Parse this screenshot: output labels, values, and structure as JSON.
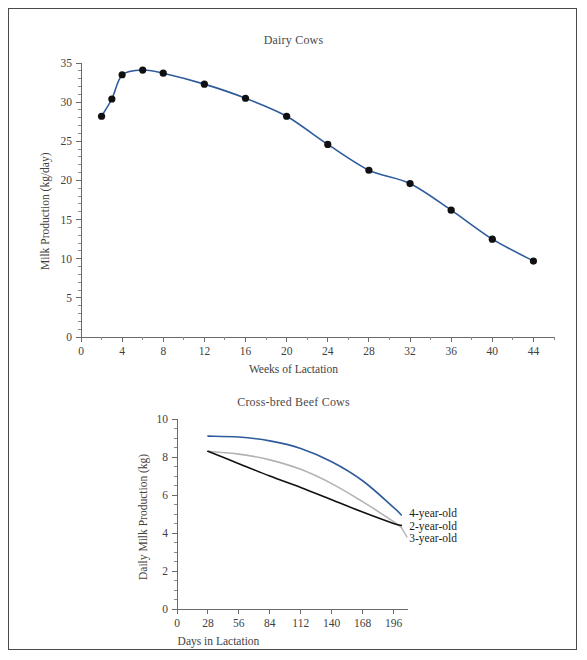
{
  "figure": {
    "border_color": "#4a4a4a",
    "background": "#ffffff"
  },
  "chart_data": [
    {
      "id": "dairy-cows",
      "type": "line",
      "title": "Dairy Cows",
      "xlabel": "Weeks of Lactation",
      "ylabel": "Milk Production (kg/day)",
      "xlim": [
        0,
        46
      ],
      "ylim": [
        0,
        35
      ],
      "xticks": [
        0,
        4,
        8,
        12,
        16,
        20,
        24,
        28,
        32,
        36,
        40,
        44
      ],
      "xtick_labels": [
        "0",
        "4",
        "8",
        "12",
        "16",
        "20",
        "24",
        "28",
        "32",
        "36",
        "40",
        "44"
      ],
      "yticks": [
        0,
        5,
        10,
        15,
        20,
        25,
        30,
        35
      ],
      "ytick_labels": [
        "0",
        "5",
        "10",
        "15",
        "20",
        "25",
        "30",
        "35"
      ],
      "y_minor_step": 1,
      "grid": false,
      "legend": "none",
      "line_color": "#2f5b9c",
      "marker_color": "#101010",
      "marker_shape": "circle",
      "x": [
        2,
        3,
        4,
        6,
        8,
        12,
        16,
        20,
        24,
        28,
        32,
        36,
        40,
        44
      ],
      "values": [
        28.2,
        30.4,
        33.5,
        34.1,
        33.7,
        32.3,
        30.5,
        28.2,
        24.6,
        21.3,
        19.6,
        16.2,
        12.5,
        9.7
      ]
    },
    {
      "id": "cross-bred-beef-cows",
      "type": "line",
      "title": "Cross-bred Beef Cows",
      "xlabel": "Days in Lactation",
      "ylabel": "Daily Milk Production (kg)",
      "xlim": [
        0,
        210
      ],
      "ylim": [
        0,
        10
      ],
      "xticks": [
        0,
        28,
        56,
        84,
        112,
        140,
        168,
        196
      ],
      "xtick_labels": [
        "0",
        "28",
        "56",
        "84",
        "112",
        "140",
        "168",
        "196"
      ],
      "yticks": [
        0,
        2,
        4,
        6,
        8,
        10
      ],
      "ytick_labels": [
        "0",
        "2",
        "4",
        "6",
        "8",
        "10"
      ],
      "y_minor_step": 0.5,
      "grid": false,
      "legend": "inline-right",
      "x": [
        28,
        56,
        84,
        112,
        140,
        168,
        196,
        203
      ],
      "series": [
        {
          "name": "4-year-old",
          "color": "#2f5b9c",
          "label_color": "#1d1d1d",
          "values": [
            9.1,
            9.05,
            8.85,
            8.45,
            7.75,
            6.75,
            5.35,
            4.95
          ]
        },
        {
          "name": "3-year-old",
          "color": "#b3b3b3",
          "label_color": "#1d1d1d",
          "values": [
            8.3,
            8.15,
            7.85,
            7.35,
            6.6,
            5.65,
            4.6,
            4.3
          ]
        },
        {
          "name": "2-year-old",
          "color": "#101010",
          "label_color": "#1d1d1d",
          "values": [
            8.3,
            7.65,
            7.0,
            6.4,
            5.75,
            5.1,
            4.5,
            4.4
          ]
        }
      ]
    }
  ]
}
